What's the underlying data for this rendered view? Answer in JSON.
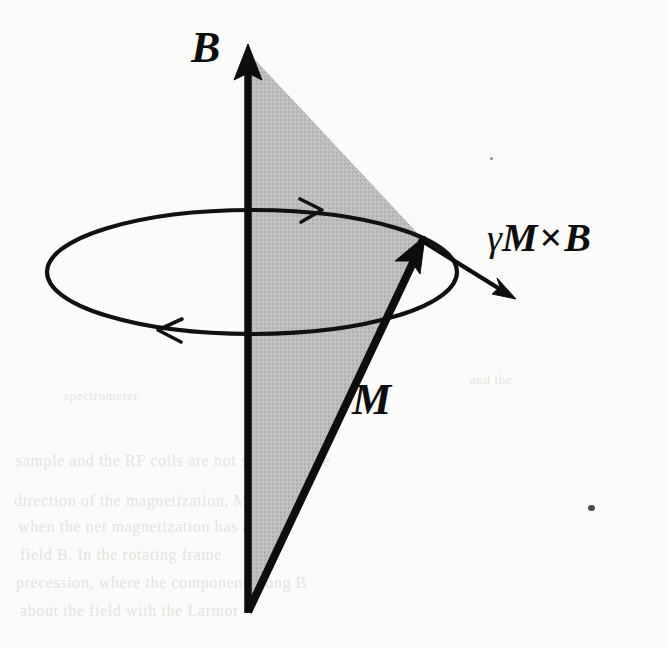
{
  "figure": {
    "kind": "physics-vector-diagram",
    "background_color": "#fbfbf9",
    "ink_color": "#0d0d0d",
    "cone_shading_color": "#b9b9b9"
  },
  "labels": {
    "field_axis": "B",
    "magnetization": "M",
    "torque_gamma": "γ",
    "torque_m": "M",
    "torque_times": "×",
    "torque_b": "B"
  },
  "elements": {
    "field_axis_name": "B field axis arrow",
    "magnetization_name": "M magnetization vector arrow",
    "torque_name": "gamma M cross B torque arrow",
    "precession_circle_name": "precession orbit ellipse",
    "cone_name": "precession cone shaded sector"
  },
  "geometry": {
    "axis_x": 248,
    "axis_top_y": 45,
    "axis_bottom_y": 613,
    "cone_apex": [
      248,
      612
    ],
    "m_tip": [
      424,
      238
    ],
    "ellipse_center": [
      252,
      272
    ],
    "ellipse_rx": 205,
    "ellipse_ry": 62,
    "torque_start": [
      420,
      240
    ],
    "torque_end": [
      513,
      298
    ]
  },
  "ghost_text": {
    "lines": [
      {
        "text": "spectrometer",
        "x": 64,
        "y": 388,
        "size": 13
      },
      {
        "text": "and the",
        "x": 470,
        "y": 372,
        "size": 13
      },
      {
        "text": "sample and the RF coils are not shown in the",
        "x": 16,
        "y": 452,
        "size": 16
      },
      {
        "text": "direction of the magnetization, M, and B",
        "x": 14,
        "y": 492,
        "size": 16
      },
      {
        "text": "when the net magnetization has a",
        "x": 18,
        "y": 518,
        "size": 16
      },
      {
        "text": "field B. In the rotating frame",
        "x": 20,
        "y": 546,
        "size": 16
      },
      {
        "text": "precession, where the component along B",
        "x": 16,
        "y": 574,
        "size": 16
      },
      {
        "text": "about the field with the Larmor",
        "x": 20,
        "y": 602,
        "size": 16
      }
    ]
  }
}
